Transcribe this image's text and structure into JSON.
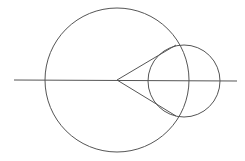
{
  "diagram": {
    "width": 245,
    "height": 161,
    "stroke_color": "#555555",
    "background": "#ffffff",
    "large_circle": {
      "cx": 117,
      "cy": 80,
      "r": 72
    },
    "small_circle": {
      "cx": 184,
      "cy": 81,
      "r": 36
    },
    "axis_line": {
      "x1": 14,
      "y1": 80,
      "x2": 237,
      "y2": 81
    },
    "tangent_lines": [
      {
        "x1": 117,
        "y1": 80,
        "x2": 176,
        "y2": 45
      },
      {
        "x1": 117,
        "y1": 80,
        "x2": 176,
        "y2": 116
      }
    ]
  }
}
